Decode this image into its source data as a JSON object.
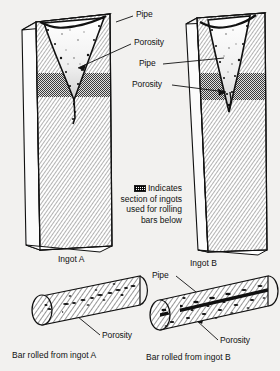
{
  "figure": {
    "background_color": "#f2f1ef",
    "ink_color": "#111111",
    "hatch_color": "#8a8a8a",
    "porosity_band_color": "#6e6e6e"
  },
  "labels": {
    "ingot_a_pipe": "Pipe",
    "ingot_a_porosity": "Porosity",
    "ingot_b_pipe": "Pipe",
    "ingot_b_porosity": "Porosity",
    "bar_a_porosity": "Porosity",
    "bar_b_pipe": "Pipe",
    "bar_b_porosity": "Porosity"
  },
  "legend": {
    "swatch_icon": "crosshatch-swatch-icon",
    "line1": "Indicates",
    "line2": "section of ingots",
    "line3": "used for rolling",
    "line4": "bars below",
    "full_text": "Indicates section of ingots used for rolling bars below"
  },
  "captions": {
    "ingot_a": "Ingot A",
    "ingot_b": "Ingot B",
    "bar_a": "Bar rolled from ingot A",
    "bar_b": "Bar rolled from ingot B"
  },
  "diagram_items": [
    {
      "name": "ingot-a",
      "caption": "Ingot A",
      "pipe": "wide shallow V-shaped shrinkage cavity at top",
      "porosity": "dark speckled band below pipe",
      "taper": "slight"
    },
    {
      "name": "ingot-b",
      "caption": "Ingot B",
      "pipe": "narrow deep V-shaped shrinkage cavity reaching into porosity band",
      "porosity": "dark speckled band below pipe",
      "taper": "strong"
    },
    {
      "name": "bar-a",
      "caption": "Bar rolled from ingot A",
      "defects": "scattered light porosity along centerline"
    },
    {
      "name": "bar-b",
      "caption": "Bar rolled from ingot B",
      "defects": "heavy continuous pipe streak with dense porosity along centerline"
    }
  ]
}
